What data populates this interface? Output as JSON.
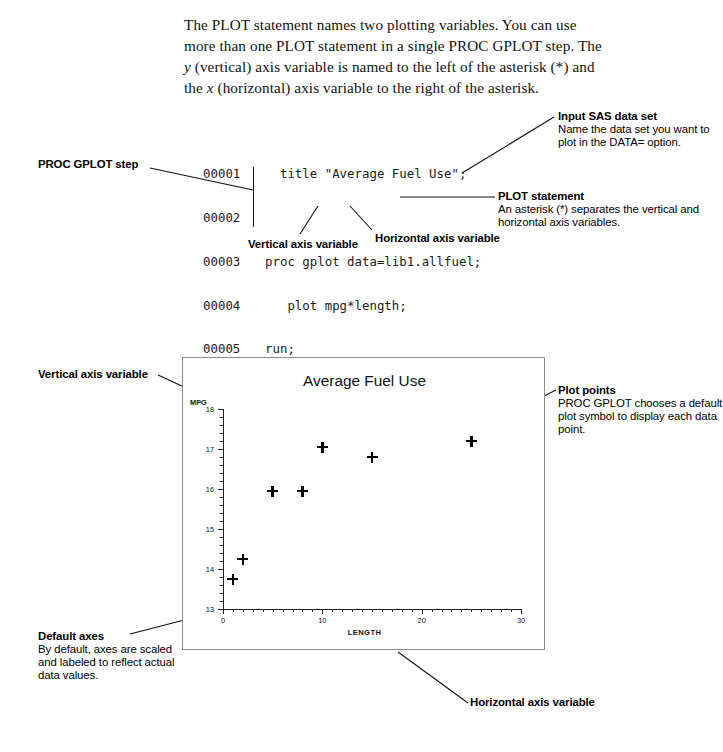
{
  "intro": {
    "part1": "The PLOT statement names two plotting variables. You can use more than one PLOT statement in a single PROC GPLOT step. The ",
    "y_ital": "y",
    "part2": " (vertical) axis variable is named to the left of the asterisk (*) and the ",
    "x_ital": "x",
    "part3": " (horizontal) axis variable to the right of the asterisk."
  },
  "code": {
    "lines": [
      {
        "number": "00001",
        "text": "  title \"Average Fuel Use\";"
      },
      {
        "number": "00002",
        "text": ""
      },
      {
        "number": "00003",
        "text": "proc gplot data=lib1.allfuel;"
      },
      {
        "number": "00004",
        "text": "   plot mpg*length;"
      },
      {
        "number": "00005",
        "text": "run;"
      },
      {
        "number": "00006",
        "text": "quit;"
      }
    ]
  },
  "callouts": {
    "proc_gplot_step": {
      "title": "PROC GPLOT step",
      "body": ""
    },
    "input_sas_data_set": {
      "title": "Input SAS data set",
      "body": "Name the data set you want to plot in the DATA= option."
    },
    "plot_statement": {
      "title": "PLOT statement",
      "body": "An asterisk (*) separates the vertical and horizontal axis variables."
    },
    "vertical_axis_variable": {
      "title": "Vertical axis variable",
      "body": ""
    },
    "horizontal_axis_variable": {
      "title": "Horizontal axis variable",
      "body": ""
    },
    "vertical_axis_variable_chart": {
      "title": "Vertical axis variable",
      "body": ""
    },
    "plot_points": {
      "title": "Plot points",
      "body": "PROC GPLOT chooses a default plot symbol to display each data point."
    },
    "default_axes": {
      "title": "Default axes",
      "body": "By default, axes are scaled and labeled to reflect actual data values."
    },
    "horizontal_axis_variable_chart": {
      "title": "Horizontal axis variable",
      "body": ""
    }
  },
  "chart_data": {
    "type": "scatter",
    "title": "Average Fuel Use",
    "xlabel": "LENGTH",
    "ylabel": "MPG",
    "xlim": [
      0,
      30
    ],
    "ylim": [
      13,
      18
    ],
    "xticks": [
      0,
      10,
      20,
      30
    ],
    "yticks": [
      13,
      14,
      15,
      16,
      17,
      18
    ],
    "x_minor_tick_step": 1,
    "y_minor_tick_step": 0.2,
    "grid": false,
    "legend": null,
    "marker": "plus",
    "marker_color": "#000000",
    "points": [
      {
        "x": 1.0,
        "y": 13.75
      },
      {
        "x": 2.0,
        "y": 14.25
      },
      {
        "x": 5.0,
        "y": 15.95
      },
      {
        "x": 8.0,
        "y": 15.95
      },
      {
        "x": 10.0,
        "y": 17.05
      },
      {
        "x": 15.0,
        "y": 16.8
      },
      {
        "x": 25.0,
        "y": 17.2
      }
    ]
  }
}
